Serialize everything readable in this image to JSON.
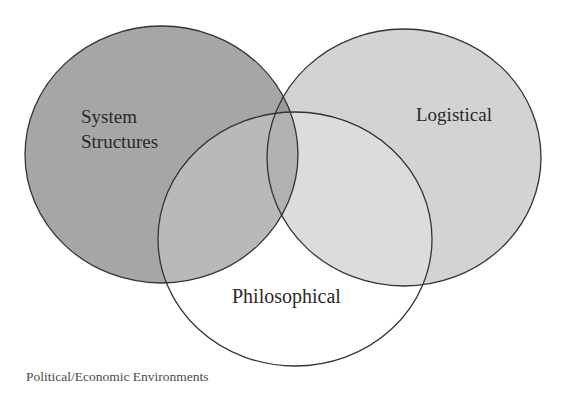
{
  "diagram": {
    "type": "venn",
    "sets": [
      {
        "id": "system_structures",
        "label_lines": [
          "System",
          "Structures"
        ],
        "fill": "#a6a6a6"
      },
      {
        "id": "logistical",
        "label": "Logistical",
        "fill": "#d3d3d3"
      },
      {
        "id": "philosophical",
        "label": "Philosophical",
        "fill": "#ffffff"
      }
    ],
    "overlap_fills": {
      "system_logistical": "#9b9b9b"
    },
    "outline_color": "#333333",
    "caption": "Political/Economic Environments"
  }
}
